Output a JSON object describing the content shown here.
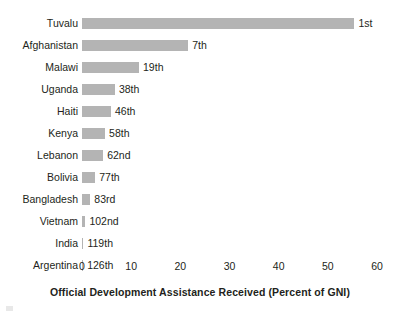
{
  "chart_data": {
    "type": "bar",
    "orientation": "horizontal",
    "title": "",
    "xlabel": "Official Development Assistance Received (Percent of GNI)",
    "ylabel": "",
    "xlim": [
      0,
      60
    ],
    "xticks": [
      0,
      10,
      20,
      30,
      40,
      50,
      60
    ],
    "xtick_labels": [
      "0",
      "10",
      "20",
      "30",
      "40",
      "50",
      "60"
    ],
    "grid": false,
    "legend": false,
    "bar_color": "#b4b4b4",
    "text_color": "#231f20",
    "categories": [
      "Tuvalu",
      "Afghanistan",
      "Malawi",
      "Uganda",
      "Haiti",
      "Kenya",
      "Lebanon",
      "Bolivia",
      "Bangladesh",
      "Vietnam",
      "India",
      "Argentina"
    ],
    "values": [
      55.4,
      21.6,
      11.6,
      6.7,
      5.9,
      4.7,
      4.3,
      2.7,
      1.7,
      0.7,
      0.3,
      0.2
    ],
    "data_labels": [
      "1st",
      "7th",
      "19th",
      "38th",
      "46th",
      "58th",
      "62nd",
      "77th",
      "83rd",
      "102nd",
      "119th",
      "126th"
    ],
    "bars": [
      {
        "category": "Tuvalu",
        "value": 55.4,
        "rank_label": "1st"
      },
      {
        "category": "Afghanistan",
        "value": 21.6,
        "rank_label": "7th"
      },
      {
        "category": "Malawi",
        "value": 11.6,
        "rank_label": "19th"
      },
      {
        "category": "Uganda",
        "value": 6.7,
        "rank_label": "38th"
      },
      {
        "category": "Haiti",
        "value": 5.9,
        "rank_label": "46th"
      },
      {
        "category": "Kenya",
        "value": 4.7,
        "rank_label": "58th"
      },
      {
        "category": "Lebanon",
        "value": 4.3,
        "rank_label": "62nd"
      },
      {
        "category": "Bolivia",
        "value": 2.7,
        "rank_label": "77th"
      },
      {
        "category": "Bangladesh",
        "value": 1.7,
        "rank_label": "83rd"
      },
      {
        "category": "Vietnam",
        "value": 0.7,
        "rank_label": "102nd"
      },
      {
        "category": "India",
        "value": 0.3,
        "rank_label": "119th"
      },
      {
        "category": "Argentina",
        "value": 0.2,
        "rank_label": "126th"
      }
    ]
  }
}
